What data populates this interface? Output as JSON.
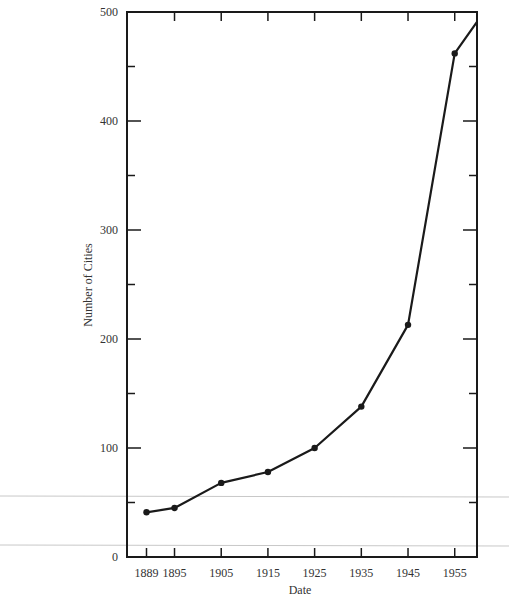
{
  "chart_data": {
    "type": "line",
    "title": "",
    "xlabel": "Date",
    "ylabel": "Number of Cities",
    "x": [
      1889,
      1895,
      1905,
      1915,
      1925,
      1935,
      1945,
      1955,
      1960
    ],
    "values": [
      41,
      45,
      68,
      78,
      100,
      138,
      213,
      462,
      491
    ],
    "series": [
      {
        "name": "Number of Cities",
        "x": [
          1889,
          1895,
          1905,
          1915,
          1925,
          1935,
          1945,
          1955,
          1960
        ],
        "values": [
          41,
          45,
          68,
          78,
          100,
          138,
          213,
          462,
          491
        ],
        "markers": [
          true,
          true,
          true,
          true,
          true,
          true,
          true,
          true,
          false
        ]
      }
    ],
    "xticks": [
      "1889",
      "1895",
      "1905",
      "1915",
      "1925",
      "1935",
      "1945",
      "1955"
    ],
    "xtick_values": [
      1889,
      1895,
      1905,
      1915,
      1925,
      1935,
      1945,
      1955
    ],
    "yticks": [
      "0",
      "100",
      "200",
      "300",
      "400",
      "500"
    ],
    "ytick_values": [
      0,
      100,
      200,
      300,
      400,
      500
    ],
    "yminor_ticks": [
      50,
      150,
      250,
      350,
      450
    ],
    "xlim": [
      1883,
      1960
    ],
    "ylim": [
      0,
      500
    ],
    "grid": false,
    "legend": null,
    "colors": {
      "line": "#1a1a1a",
      "axis": "#1a1a1a",
      "text": "#333333",
      "artifact": "#c8c8c8"
    }
  }
}
